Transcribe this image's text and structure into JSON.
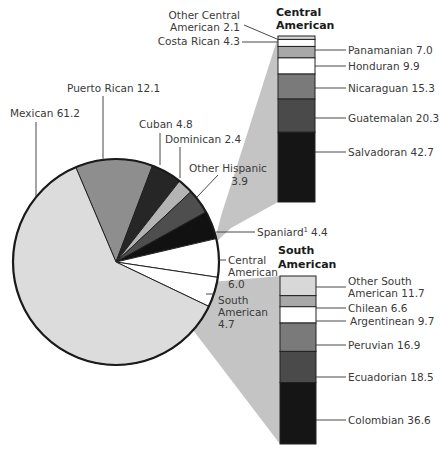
{
  "chart_data": [
    {
      "type": "pie",
      "title": "",
      "unit": "percent",
      "slices": [
        {
          "label": "Mexican",
          "value": 61.2,
          "color": "#dcdcdc"
        },
        {
          "label": "Puerto Rican",
          "value": 12.1,
          "color": "#8e8e8e"
        },
        {
          "label": "Cuban",
          "value": 4.8,
          "color": "#262626"
        },
        {
          "label": "Dominican",
          "value": 2.4,
          "color": "#b4b4b4"
        },
        {
          "label": "Other Hispanic",
          "value": 3.9,
          "color": "#4e4e4e"
        },
        {
          "label": "Spaniard",
          "value": 4.4,
          "color": "#111111",
          "footnote": "1"
        },
        {
          "label": "Central American",
          "value": 6.0,
          "color": "#ffffff"
        },
        {
          "label": "South American",
          "value": 4.7,
          "color": "#ffffff"
        }
      ]
    },
    {
      "type": "bar",
      "stacked": true,
      "title": "Central American",
      "unit": "percent",
      "segments": [
        {
          "label": "Other Central American",
          "value": 2.1,
          "color": "#d8d8d8"
        },
        {
          "label": "Costa Rican",
          "value": 4.3,
          "color": "#ffffff"
        },
        {
          "label": "Panamanian",
          "value": 7.0,
          "color": "#a8a8a8"
        },
        {
          "label": "Honduran",
          "value": 9.9,
          "color": "#ffffff"
        },
        {
          "label": "Nicaraguan",
          "value": 15.3,
          "color": "#7a7a7a"
        },
        {
          "label": "Guatemalan",
          "value": 20.3,
          "color": "#4a4a4a"
        },
        {
          "label": "Salvadoran",
          "value": 42.7,
          "color": "#151515"
        }
      ]
    },
    {
      "type": "bar",
      "stacked": true,
      "title": "South American",
      "unit": "percent",
      "segments": [
        {
          "label": "Other South American",
          "value": 11.7,
          "color": "#d8d8d8"
        },
        {
          "label": "Chilean",
          "value": 6.6,
          "color": "#a8a8a8"
        },
        {
          "label": "Argentinean",
          "value": 9.7,
          "color": "#ffffff"
        },
        {
          "label": "Peruvian",
          "value": 16.9,
          "color": "#7a7a7a"
        },
        {
          "label": "Ecuadorian",
          "value": 18.5,
          "color": "#4a4a4a"
        },
        {
          "label": "Colombian",
          "value": 36.6,
          "color": "#151515"
        }
      ]
    }
  ],
  "labels": {
    "mexican": "Mexican 61.2",
    "puerto_rican": "Puerto Rican 12.1",
    "cuban": "Cuban 4.8",
    "dominican": "Dominican 2.4",
    "other_hispanic_1": "Other Hispanic",
    "other_hispanic_2": "3.9",
    "spaniard": "Spaniard",
    "spaniard_sup": "1",
    "spaniard_val": "4.4",
    "central_1": "Central",
    "central_2": "American",
    "central_3": "6.0",
    "south_1": "South",
    "south_2": "American",
    "south_3": "4.7",
    "ca_header_1": "Central",
    "ca_header_2": "American",
    "sa_header_1": "South",
    "sa_header_2": "American",
    "other_ca_1": "Other Central",
    "other_ca_2": "American 2.1",
    "costa_rican": "Costa Rican 4.3",
    "panamanian": "Panamanian 7.0",
    "honduran": "Honduran 9.9",
    "nicaraguan": "Nicaraguan 15.3",
    "guatemalan": "Guatemalan 20.3",
    "salvadoran": "Salvadoran 42.7",
    "other_sa_1": "Other South",
    "other_sa_2": "American 11.7",
    "chilean": "Chilean 6.6",
    "argentinean": "Argentinean 9.7",
    "peruvian": "Peruvian 16.9",
    "ecuadorian": "Ecuadorian 18.5",
    "colombian": "Colombian 36.6"
  }
}
